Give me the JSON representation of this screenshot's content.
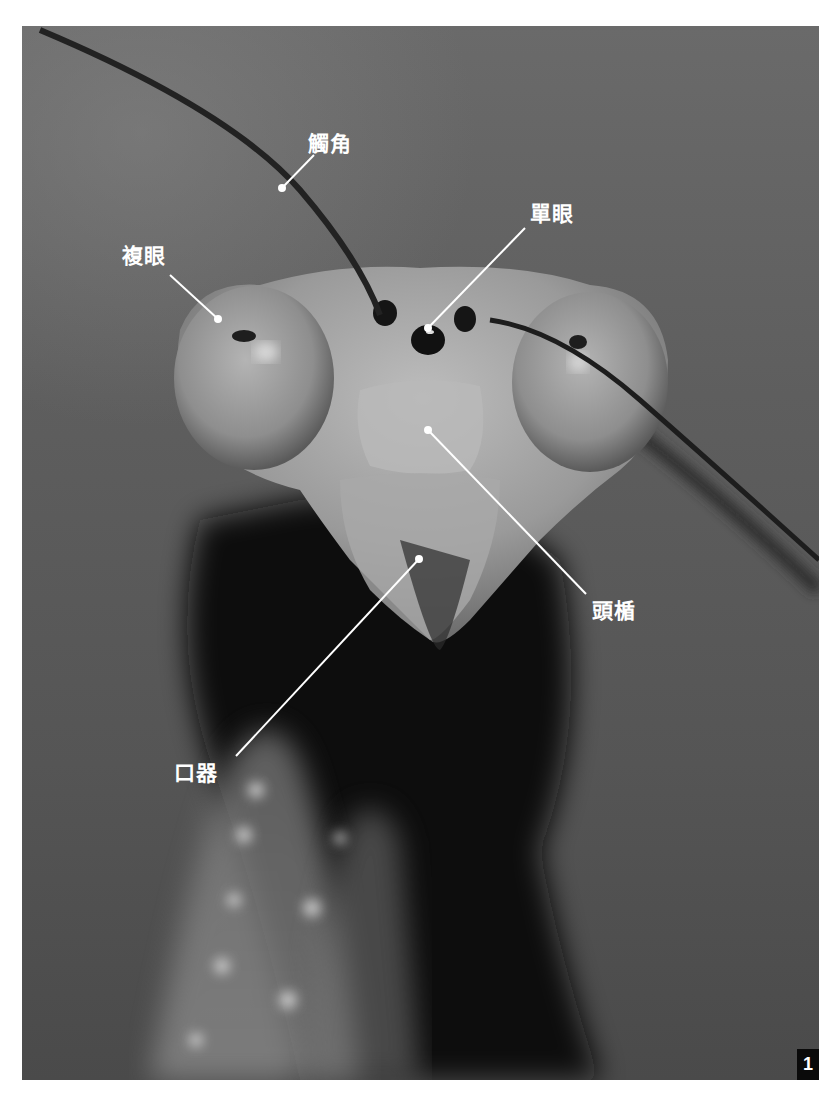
{
  "figure": {
    "number": "1",
    "colors": {
      "background": "#5e5e5e",
      "label_text": "#ffffff",
      "leader_line": "#ffffff",
      "number_badge": "#0a0a0a"
    }
  },
  "labels": [
    {
      "id": "antenna",
      "text": "觸角",
      "x": 308,
      "y": 134,
      "line": {
        "from": [
          314,
          155
        ],
        "to": [
          282,
          188
        ]
      }
    },
    {
      "id": "compound-eye",
      "text": "複眼",
      "x": 122,
      "y": 246,
      "line": {
        "from": [
          170,
          275
        ],
        "to": [
          218,
          319
        ]
      }
    },
    {
      "id": "ocellus",
      "text": "單眼",
      "x": 530,
      "y": 204,
      "line": {
        "from": [
          525,
          228
        ],
        "to": [
          428,
          328
        ]
      }
    },
    {
      "id": "clypeus",
      "text": "頭楯",
      "x": 592,
      "y": 601,
      "line": {
        "from": [
          428,
          430
        ],
        "to": [
          586,
          594
        ]
      }
    },
    {
      "id": "mouthparts",
      "text": "口器",
      "x": 174,
      "y": 763,
      "line": {
        "from": [
          236,
          756
        ],
        "to": [
          419,
          559
        ]
      }
    }
  ]
}
